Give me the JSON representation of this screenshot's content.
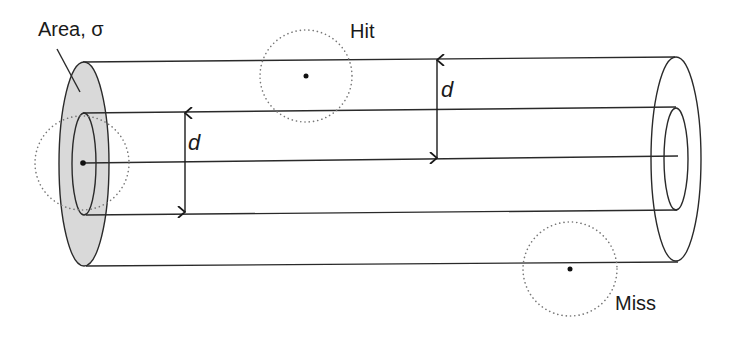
{
  "diagram": {
    "type": "cross-section cylinder illustration",
    "labels": {
      "area": "Area, σ",
      "hit": "Hit",
      "miss": "Miss",
      "distance_left": "d",
      "distance_right": "d"
    },
    "colors": {
      "shaded_area": "#d9d9d9",
      "line": "#2a2a2a",
      "dotted_circle": "#777777"
    }
  }
}
